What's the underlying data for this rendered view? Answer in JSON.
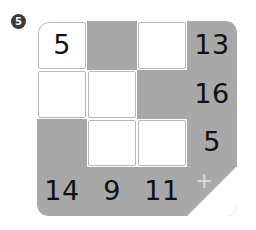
{
  "problem": {
    "number": "5",
    "badge_color": "#3a3a3a"
  },
  "palette": {
    "shaded_cell": "#a8a8a8",
    "open_cell": "#ffffff",
    "digit_color": "#111111",
    "plus_color": "#dcdcdc"
  },
  "grid": {
    "rows": 4,
    "cols": 4,
    "operator_symbol": "+",
    "cells": [
      {
        "value": "5",
        "shaded": false,
        "kind": "given"
      },
      {
        "value": "",
        "shaded": true,
        "kind": "blank"
      },
      {
        "value": "",
        "shaded": false,
        "kind": "blank"
      },
      {
        "value": "13",
        "shaded": true,
        "kind": "sum-row"
      },
      {
        "value": "",
        "shaded": false,
        "kind": "blank"
      },
      {
        "value": "",
        "shaded": false,
        "kind": "blank"
      },
      {
        "value": "",
        "shaded": true,
        "kind": "blank"
      },
      {
        "value": "16",
        "shaded": true,
        "kind": "sum-row"
      },
      {
        "value": "",
        "shaded": true,
        "kind": "blank"
      },
      {
        "value": "",
        "shaded": false,
        "kind": "blank"
      },
      {
        "value": "",
        "shaded": false,
        "kind": "blank"
      },
      {
        "value": "5",
        "shaded": true,
        "kind": "sum-row"
      },
      {
        "value": "14",
        "shaded": true,
        "kind": "sum-col"
      },
      {
        "value": "9",
        "shaded": true,
        "kind": "sum-col"
      },
      {
        "value": "11",
        "shaded": true,
        "kind": "sum-col"
      },
      {
        "value": "+",
        "shaded": true,
        "kind": "operator"
      }
    ]
  }
}
